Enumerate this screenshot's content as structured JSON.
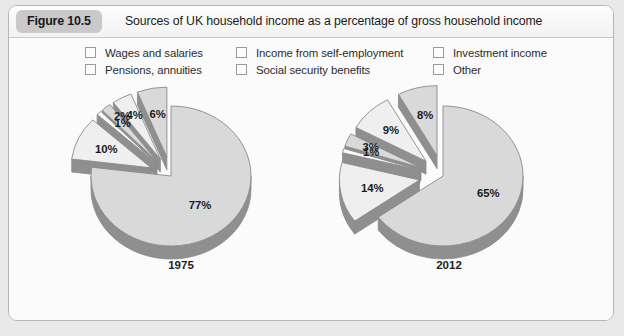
{
  "figure": {
    "badge": "Figure 10.5",
    "title": "Sources of UK household income as a percentage of gross household income"
  },
  "legend": {
    "columns": [
      {
        "items": [
          {
            "label": "Wages and salaries",
            "icon": "legend-swatch-icon"
          },
          {
            "label": "Pensions, annuities",
            "icon": "legend-swatch-icon"
          }
        ]
      },
      {
        "items": [
          {
            "label": "Income from self-employment",
            "icon": "legend-swatch-icon"
          },
          {
            "label": "Social security benefits",
            "icon": "legend-swatch-icon"
          }
        ]
      },
      {
        "items": [
          {
            "label": "Investment income",
            "icon": "legend-swatch-icon"
          },
          {
            "label": "Other",
            "icon": "legend-swatch-icon"
          }
        ]
      }
    ]
  },
  "colors": {
    "slice_face": "#d9d9d9",
    "slice_face_light": "#efefef",
    "slice_face_white": "#fafafa",
    "slice_edge": "#8a8a8a",
    "slice_side": "#8f8f8f",
    "panel_background": "#fbfbfb",
    "panel_border": "#b6b6b6",
    "badge_background": "#c9c9c9",
    "page_background": "#e9e9e9",
    "text": "#1b1b1b"
  },
  "chart_data": [
    {
      "type": "pie",
      "title": "1975",
      "labels": [
        "Wages and salaries",
        "Income from self-employment",
        "Investment income",
        "Pensions, annuities",
        "Social security benefits",
        "Other"
      ],
      "values": [
        77,
        10,
        1,
        2,
        4,
        6
      ],
      "value_labels": [
        "77%",
        "10%",
        "1%",
        "2%",
        "4%",
        "6%"
      ],
      "units": "percent",
      "legend_position": "top",
      "exploded": [
        false,
        true,
        true,
        true,
        true,
        true
      ]
    },
    {
      "type": "pie",
      "title": "2012",
      "labels": [
        "Wages and salaries",
        "Income from self-employment",
        "Investment income",
        "Pensions, annuities",
        "Social security benefits",
        "Other"
      ],
      "values": [
        65,
        14,
        1,
        3,
        9,
        8
      ],
      "value_labels": [
        "65%",
        "14%",
        "1%",
        "3%",
        "9%",
        "8%"
      ],
      "units": "percent",
      "legend_position": "top",
      "exploded": [
        false,
        true,
        true,
        true,
        true,
        true
      ]
    }
  ],
  "years": {
    "left": "1975",
    "right": "2012"
  }
}
